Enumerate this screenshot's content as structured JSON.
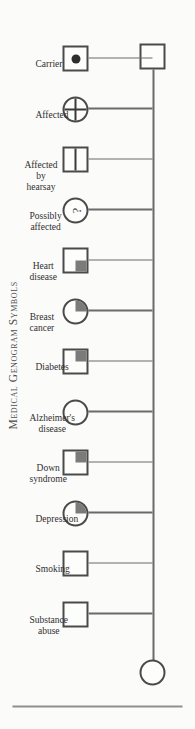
{
  "figure": {
    "title": "Medical Genogram Symbols",
    "title_first_letters": "MGS",
    "orientation": "rotated-90-counterclockwise",
    "background_color": "#fbfbfa",
    "line_color": "#6a6a6a",
    "symbol_stroke_color": "#4a4a4a",
    "fill_color": "#7b7b7b"
  },
  "root": {
    "name": "root-circle",
    "shape": "circle",
    "fill": "none"
  },
  "tail": {
    "name": "tail-square",
    "shape": "square",
    "fill": "none"
  },
  "legend": {
    "entries": [
      {
        "label_lines": [
          "Substance",
          "abuse"
        ],
        "label": "Substance abuse",
        "shape": "square",
        "fill": "none"
      },
      {
        "label_lines": [
          "Smoking"
        ],
        "label": "Smoking",
        "shape": "square",
        "fill": "none"
      },
      {
        "label_lines": [
          "Depression"
        ],
        "label": "Depression",
        "shape": "circle",
        "fill": "quarter-bottom-right"
      },
      {
        "label_lines": [
          "Down",
          "syndrome"
        ],
        "label": "Down syndrome",
        "shape": "square",
        "fill": "quarter-bottom-right"
      },
      {
        "label_lines": [
          "Alzheimer's",
          "disease"
        ],
        "label": "Alzheimer's disease",
        "shape": "circle",
        "fill": "none"
      },
      {
        "label_lines": [
          "Diabetes"
        ],
        "label": "Diabetes",
        "shape": "square",
        "fill": "quarter-bottom-right"
      },
      {
        "label_lines": [
          "Breast",
          "cancer"
        ],
        "label": "Breast cancer",
        "shape": "circle",
        "fill": "quarter-bottom-right"
      },
      {
        "label_lines": [
          "Heart",
          "disease"
        ],
        "label": "Heart disease",
        "shape": "square",
        "fill": "quarter-bottom-left"
      },
      {
        "label_lines": [
          "Possibly",
          "affected"
        ],
        "label": "Possibly affected",
        "shape": "circle",
        "fill": "question-mark",
        "glyph": "?"
      },
      {
        "label_lines": [
          "Affected",
          "by",
          "hearsay"
        ],
        "label": "Affected by hearsay",
        "shape": "square",
        "fill": "horizontal-bar"
      },
      {
        "label_lines": [
          "Affected"
        ],
        "label": "Affected",
        "shape": "circle",
        "fill": "cross"
      },
      {
        "label_lines": [
          "Carrier"
        ],
        "label": "Carrier",
        "shape": "square",
        "fill": "center-dot"
      }
    ]
  }
}
